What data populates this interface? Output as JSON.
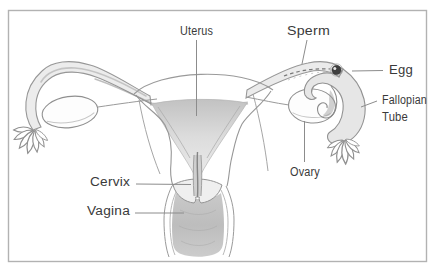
{
  "figure": {
    "type": "anatomical-line-diagram",
    "labels": {
      "uterus": "Uterus",
      "sperm": "Sperm",
      "egg": "Egg",
      "fallopian_line1": "Fallopian",
      "fallopian_line2": "Tube",
      "ovary": "Ovary",
      "cervix": "Cervix",
      "vagina": "Vagina"
    },
    "colors": {
      "background": "#ffffff",
      "frame_border": "#b2b2b2",
      "outline": "#949494",
      "shading_light": "#ececec",
      "shading_mid": "#cfcfcf",
      "leader_line": "#8c8c8c",
      "label_text": "#3a3a3a",
      "egg_dot": "#3f3f3f"
    }
  }
}
